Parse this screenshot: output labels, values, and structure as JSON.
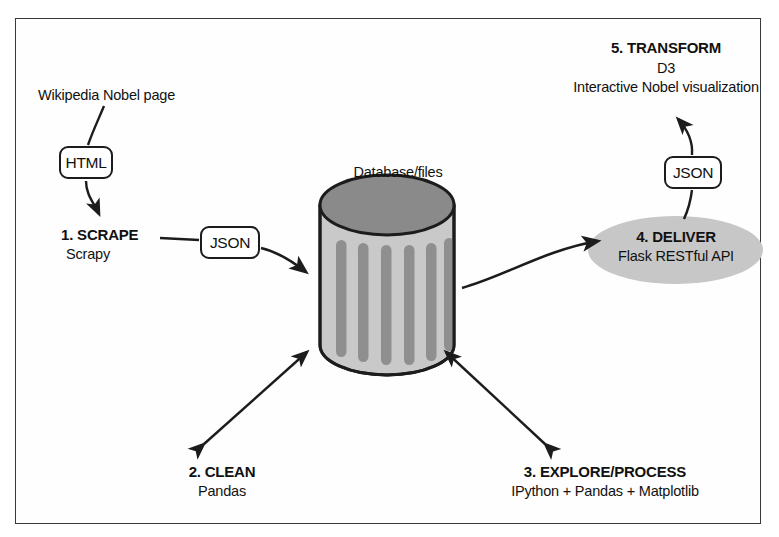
{
  "diagram": {
    "title_text_nodes": {
      "source_label": "Wikipedia Nobel page",
      "database_label": "Database/files"
    },
    "steps": [
      {
        "id": "scrape",
        "heading": "1. SCRAPE",
        "subtitle": "Scrapy"
      },
      {
        "id": "clean",
        "heading": "2. CLEAN",
        "subtitle": "Pandas"
      },
      {
        "id": "explore",
        "heading": "3. EXPLORE/PROCESS",
        "subtitle": "IPython + Pandas + Matplotlib"
      },
      {
        "id": "deliver",
        "heading": "4. DELIVER",
        "subtitle": "Flask RESTful API"
      },
      {
        "id": "transform",
        "heading": "5. TRANSFORM",
        "subtitle": "D3",
        "subtitle2": "Interactive Nobel visualization"
      }
    ],
    "data_boxes": {
      "html": "HTML",
      "json_scrape": "JSON",
      "json_deliver": "JSON"
    },
    "colors": {
      "frame_border": "#3a3a3a",
      "stroke": "#1c1c1c",
      "cylinder_top": "#8a8a8a",
      "cylinder_body": "#c9c9c9",
      "cylinder_stripe": "#8f8f8f",
      "deliver_fill": "#c7c7c7",
      "text": "#111111",
      "background": "#ffffff"
    }
  }
}
